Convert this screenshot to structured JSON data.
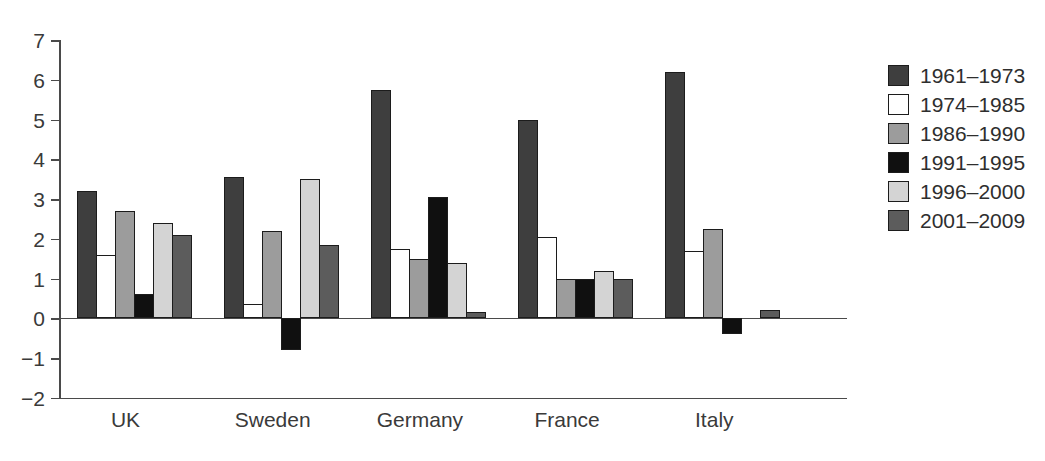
{
  "figure": {
    "background": "#ffffff",
    "axis_color": "#4a4a4a",
    "text_color": "#3a3a3a",
    "bar_border_color": "#1c1c1c"
  },
  "chart_data": {
    "type": "bar",
    "title": "",
    "xlabel": "",
    "ylabel": "",
    "categories": [
      "UK",
      "Sweden",
      "Germany",
      "France",
      "Italy"
    ],
    "series": [
      {
        "name": "1961–1973",
        "color": "#3e3e3e",
        "values": [
          3.2,
          3.55,
          5.75,
          5.0,
          6.2
        ]
      },
      {
        "name": "1974–1985",
        "color": "#ffffff",
        "values": [
          1.6,
          0.35,
          1.75,
          2.05,
          1.7
        ]
      },
      {
        "name": "1986–1990",
        "color": "#9c9c9c",
        "values": [
          2.7,
          2.2,
          1.5,
          1.0,
          2.25
        ]
      },
      {
        "name": "1991–1995",
        "color": "#101010",
        "values": [
          0.6,
          -0.8,
          3.05,
          1.0,
          -0.4
        ]
      },
      {
        "name": "1996–2000",
        "color": "#d4d4d4",
        "values": [
          2.4,
          3.5,
          1.4,
          1.2,
          0
        ]
      },
      {
        "name": "2001–2009",
        "color": "#5c5c5c",
        "values": [
          2.1,
          1.85,
          0.15,
          1.0,
          0.2
        ]
      }
    ],
    "ylim": [
      -2,
      7
    ],
    "ytick_labels": [
      "7",
      "6",
      "5",
      "4",
      "3",
      "2",
      "1",
      "0",
      "−1",
      "−2"
    ],
    "ytick_values": [
      7,
      6,
      5,
      4,
      3,
      2,
      1,
      0,
      -1,
      -2
    ],
    "grid": false,
    "legend_position": "right",
    "legend_labels": [
      "1961–1973",
      "1974–1985",
      "1986–1990",
      "1991–1995",
      "1996–2000",
      "2001–2009"
    ]
  }
}
